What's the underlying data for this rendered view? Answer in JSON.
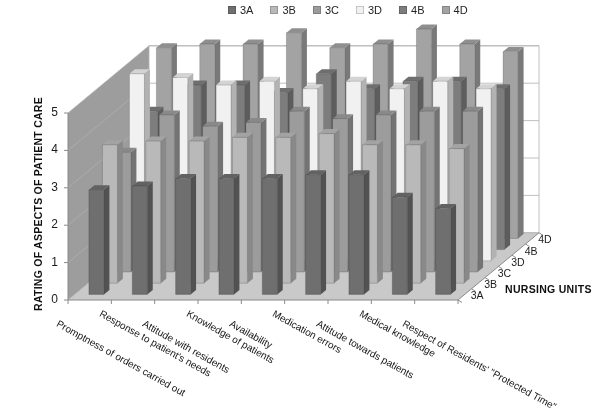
{
  "chart_data": {
    "type": "bar",
    "subtype": "3d-grouped-bar",
    "title": "",
    "xlabel": "",
    "ylabel": "RATING OF ASPECTS OF PATIENT CARE",
    "zlabel": "NURSING UNITS",
    "ylim": [
      0,
      5
    ],
    "y_ticks": [
      "0",
      "1",
      "2",
      "3",
      "4",
      "5"
    ],
    "grid": true,
    "legend_position": "top-center",
    "categories": [
      "Promptness of orders carried out",
      "Response to patient's needs",
      "Attitude with residents",
      "Knowledge of patients",
      "Availability",
      "Medication errors",
      "Attitude towards patients",
      "Medical knowledge",
      "Respect of Residents' \"Protected Time\""
    ],
    "depth_categories": [
      "3A",
      "3B",
      "3C",
      "3D",
      "4B",
      "4D"
    ],
    "series": [
      {
        "name": "3A",
        "color": "#6f6f6f",
        "values": [
          2.8,
          2.9,
          3.1,
          3.1,
          3.1,
          3.2,
          3.2,
          2.6,
          2.3
        ]
      },
      {
        "name": "3B",
        "color": "#b9b9b9",
        "values": [
          3.7,
          3.8,
          3.8,
          3.9,
          3.9,
          4.0,
          3.7,
          3.7,
          3.6
        ]
      },
      {
        "name": "3C",
        "color": "#9c9c9c",
        "values": [
          3.2,
          4.2,
          3.9,
          4.0,
          4.3,
          4.1,
          4.2,
          4.3,
          4.3
        ]
      },
      {
        "name": "3D",
        "color": "#f1f1f1",
        "values": [
          5.0,
          4.9,
          4.7,
          4.8,
          4.6,
          4.8,
          4.6,
          4.8,
          4.6
        ]
      },
      {
        "name": "4B",
        "color": "#7d7d7d",
        "values": [
          3.7,
          4.4,
          4.4,
          4.2,
          4.7,
          4.3,
          4.5,
          4.5,
          4.3
        ]
      },
      {
        "name": "4D",
        "color": "#a3a3a3",
        "values": [
          5.1,
          5.2,
          5.2,
          5.5,
          5.1,
          5.2,
          5.6,
          5.2,
          5.0
        ]
      }
    ]
  },
  "legend": {
    "items": [
      {
        "label": "3A",
        "color": "#6f6f6f"
      },
      {
        "label": "3B",
        "color": "#b9b9b9"
      },
      {
        "label": "3C",
        "color": "#9c9c9c"
      },
      {
        "label": "3D",
        "color": "#f1f1f1"
      },
      {
        "label": "4B",
        "color": "#7d7d7d"
      },
      {
        "label": "4D",
        "color": "#a3a3a3"
      }
    ]
  },
  "axes": {
    "y_title": "RATING OF ASPECTS OF PATIENT CARE",
    "z_title": "NURSING UNITS"
  },
  "colors": {
    "back_wall": "#ffffff",
    "side_wall": "#9d9d9d",
    "floor": "#c9c9c9",
    "gridline": "#b0b0b0",
    "axis_line": "#8a8a8a",
    "text": "#1a1a1a"
  }
}
